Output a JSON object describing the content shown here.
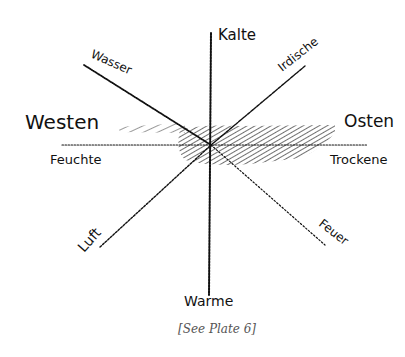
{
  "labels": {
    "kalte": "Kalte",
    "warme": "Warme",
    "westen": "Westen",
    "osten": "Osten",
    "feuchte": "Feuchte",
    "trockene": "Trockene",
    "wasser": "Wasser",
    "irdische": "Irdische",
    "luft": "Luft",
    "feuer": "Feuer"
  },
  "caption": "[See Plate 6]",
  "colors": {
    "ink": "#111111",
    "caption": "#555555",
    "background": "#ffffff"
  }
}
